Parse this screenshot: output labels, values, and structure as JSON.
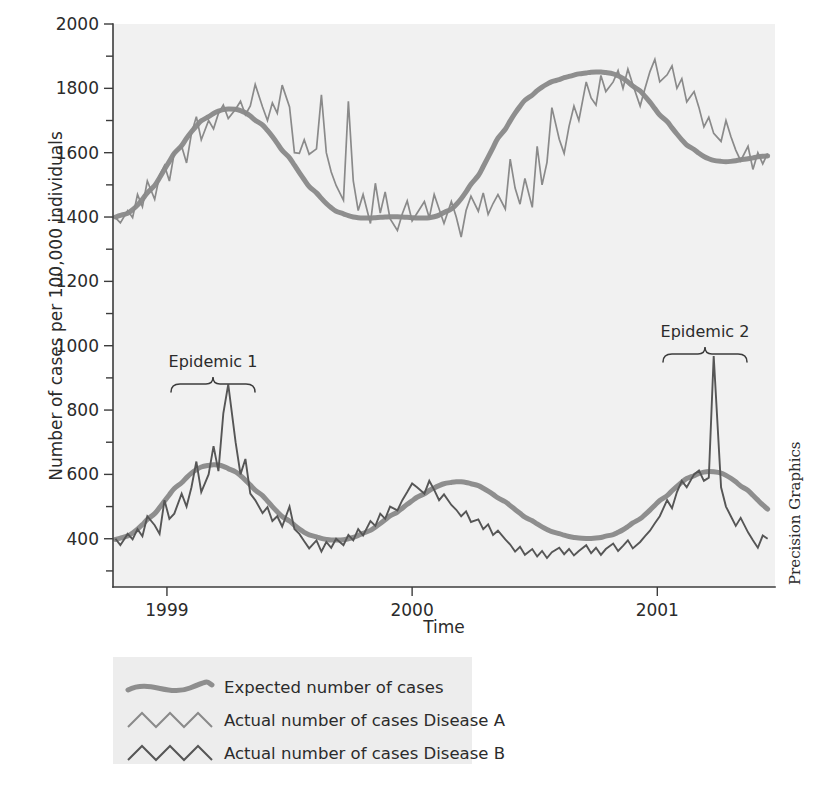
{
  "credit": "Precision Graphics",
  "annotations": [
    {
      "label": "Epidemic 1",
      "x_center": 213,
      "text_y": 367,
      "brace_y": 383,
      "brace_half": 42
    },
    {
      "label": "Epidemic 2",
      "x_center": 705,
      "text_y": 337,
      "brace_y": 353,
      "brace_half": 42
    }
  ],
  "legend": {
    "items": [
      {
        "label": "Expected number of cases",
        "style": "smooth",
        "color": "#8e8e8e"
      },
      {
        "label": "Actual number of cases Disease A",
        "style": "zigzag",
        "color": "#8a8a8a"
      },
      {
        "label": "Actual number of cases Disease B",
        "style": "zigzag",
        "color": "#565656"
      }
    ]
  },
  "chart_data": {
    "type": "line",
    "title": "",
    "xlabel": "Time",
    "ylabel": "Number of cases per 100,000 individuals",
    "xlim": [
      1998.78,
      2001.48
    ],
    "ylim": [
      250,
      2000
    ],
    "grid": false,
    "legend_position": "below-plot",
    "x_ticks": [
      {
        "value": 1999,
        "label": "1999"
      },
      {
        "value": 2000,
        "label": "2000"
      },
      {
        "value": 2001,
        "label": "2001"
      }
    ],
    "y_ticks_major": [
      {
        "value": 400,
        "label": "400"
      },
      {
        "value": 600,
        "label": "600"
      },
      {
        "value": 800,
        "label": "800"
      },
      {
        "value": 1000,
        "label": "1000"
      },
      {
        "value": 1200,
        "label": "1200"
      },
      {
        "value": 1400,
        "label": "1400"
      },
      {
        "value": 1600,
        "label": "1600"
      },
      {
        "value": 1800,
        "label": "1800"
      },
      {
        "value": 2000,
        "label": "2000"
      }
    ],
    "y_ticks_minor": [
      300,
      500,
      700,
      900,
      1100,
      1300,
      1500,
      1700,
      1900
    ],
    "x": [
      1998.79,
      1998.81,
      1998.84,
      1998.86,
      1998.88,
      1998.9,
      1998.92,
      1998.95,
      1998.97,
      1998.99,
      1999.01,
      1999.03,
      1999.06,
      1999.08,
      1999.1,
      1999.12,
      1999.14,
      1999.17,
      1999.19,
      1999.21,
      1999.23,
      1999.25,
      1999.28,
      1999.3,
      1999.32,
      1999.34,
      1999.36,
      1999.39,
      1999.41,
      1999.43,
      1999.45,
      1999.47,
      1999.5,
      1999.52,
      1999.54,
      1999.56,
      1999.58,
      1999.61,
      1999.63,
      1999.65,
      1999.67,
      1999.69,
      1999.72,
      1999.74,
      1999.76,
      1999.78,
      1999.8,
      1999.83,
      1999.85,
      1999.87,
      1999.89,
      1999.91,
      1999.94,
      1999.96,
      1999.98,
      2000.0,
      2000.02,
      2000.05,
      2000.07,
      2000.09,
      2000.11,
      2000.13,
      2000.16,
      2000.18,
      2000.2,
      2000.22,
      2000.24,
      2000.27,
      2000.29,
      2000.31,
      2000.33,
      2000.35,
      2000.38,
      2000.4,
      2000.42,
      2000.44,
      2000.46,
      2000.49,
      2000.51,
      2000.53,
      2000.55,
      2000.57,
      2000.6,
      2000.62,
      2000.64,
      2000.66,
      2000.68,
      2000.71,
      2000.73,
      2000.75,
      2000.77,
      2000.79,
      2000.82,
      2000.84,
      2000.86,
      2000.88,
      2000.9,
      2000.93,
      2000.95,
      2000.97,
      2000.99,
      2001.01,
      2001.04,
      2001.06,
      2001.08,
      2001.1,
      2001.12,
      2001.15,
      2001.17,
      2001.19,
      2001.21,
      2001.23,
      2001.26,
      2001.28,
      2001.3,
      2001.32,
      2001.34,
      2001.37,
      2001.39,
      2001.41,
      2001.43,
      2001.45
    ],
    "series": [
      {
        "name": "Expected number of cases",
        "role": "expected",
        "applies_to": "Disease A",
        "color": "#8e8e8e",
        "values": [
          1400,
          1405,
          1412,
          1423,
          1437,
          1455,
          1475,
          1498,
          1522,
          1548,
          1573,
          1598,
          1622,
          1645,
          1665,
          1683,
          1699,
          1712,
          1722,
          1729,
          1734,
          1736,
          1735,
          1731,
          1724,
          1714,
          1701,
          1686,
          1669,
          1650,
          1629,
          1607,
          1584,
          1561,
          1538,
          1516,
          1495,
          1475,
          1458,
          1442,
          1429,
          1418,
          1410,
          1404,
          1400,
          1398,
          1397,
          1397,
          1398,
          1399,
          1400,
          1401,
          1401,
          1400,
          1399,
          1398,
          1397,
          1397,
          1398,
          1401,
          1406,
          1414,
          1425,
          1439,
          1457,
          1478,
          1502,
          1529,
          1557,
          1586,
          1616,
          1645,
          1673,
          1699,
          1723,
          1744,
          1763,
          1779,
          1793,
          1804,
          1813,
          1821,
          1827,
          1833,
          1837,
          1841,
          1845,
          1848,
          1850,
          1851,
          1851,
          1849,
          1845,
          1839,
          1831,
          1820,
          1807,
          1792,
          1775,
          1757,
          1737,
          1717,
          1697,
          1677,
          1658,
          1640,
          1624,
          1610,
          1598,
          1588,
          1581,
          1576,
          1573,
          1572,
          1573,
          1575,
          1578,
          1581,
          1584,
          1587,
          1589,
          1590
        ]
      },
      {
        "name": "Actual number of cases Disease A",
        "role": "actual",
        "color": "#8a8a8a",
        "values": [
          1398,
          1382,
          1420,
          1398,
          1470,
          1432,
          1512,
          1455,
          1530,
          1560,
          1512,
          1600,
          1620,
          1568,
          1660,
          1712,
          1640,
          1700,
          1674,
          1722,
          1748,
          1706,
          1735,
          1760,
          1718,
          1745,
          1812,
          1742,
          1700,
          1755,
          1723,
          1810,
          1742,
          1600,
          1598,
          1640,
          1595,
          1612,
          1780,
          1600,
          1540,
          1498,
          1452,
          1760,
          1512,
          1420,
          1470,
          1380,
          1505,
          1412,
          1478,
          1395,
          1358,
          1410,
          1450,
          1388,
          1412,
          1448,
          1398,
          1470,
          1425,
          1380,
          1448,
          1400,
          1338,
          1420,
          1465,
          1418,
          1475,
          1408,
          1442,
          1470,
          1425,
          1580,
          1490,
          1440,
          1520,
          1430,
          1620,
          1500,
          1570,
          1740,
          1642,
          1598,
          1682,
          1745,
          1700,
          1820,
          1770,
          1748,
          1840,
          1790,
          1820,
          1855,
          1800,
          1860,
          1812,
          1745,
          1800,
          1852,
          1890,
          1820,
          1842,
          1870,
          1800,
          1830,
          1758,
          1790,
          1740,
          1680,
          1710,
          1660,
          1635,
          1700,
          1650,
          1608,
          1575,
          1620,
          1548,
          1600,
          1565,
          1598
        ]
      },
      {
        "name": "Expected number of cases",
        "role": "expected",
        "applies_to": "Disease B",
        "color": "#8e8e8e",
        "values": [
          398,
          402,
          409,
          418,
          430,
          444,
          460,
          478,
          497,
          517,
          537,
          556,
          574,
          590,
          604,
          615,
          623,
          628,
          630,
          629,
          625,
          618,
          608,
          596,
          582,
          567,
          551,
          534,
          517,
          500,
          484,
          469,
          455,
          442,
          430,
          420,
          412,
          406,
          401,
          398,
          396,
          396,
          397,
          400,
          404,
          410,
          417,
          426,
          436,
          447,
          459,
          471,
          483,
          495,
          507,
          518,
          529,
          540,
          550,
          558,
          565,
          571,
          575,
          577,
          577,
          575,
          571,
          565,
          557,
          548,
          538,
          527,
          515,
          503,
          491,
          479,
          467,
          456,
          446,
          437,
          429,
          422,
          416,
          411,
          407,
          404,
          402,
          401,
          401,
          402,
          404,
          408,
          413,
          420,
          428,
          438,
          449,
          462,
          475,
          489,
          504,
          519,
          534,
          549,
          563,
          576,
          587,
          596,
          603,
          607,
          609,
          608,
          604,
          597,
          588,
          577,
          564,
          550,
          535,
          520,
          505,
          492
        ]
      },
      {
        "name": "Actual number of cases Disease B",
        "role": "actual",
        "color": "#565656",
        "values": [
          400,
          380,
          415,
          398,
          430,
          408,
          470,
          442,
          415,
          520,
          462,
          478,
          540,
          500,
          560,
          640,
          545,
          600,
          688,
          610,
          790,
          880,
          700,
          600,
          648,
          540,
          520,
          480,
          498,
          455,
          470,
          438,
          500,
          430,
          415,
          392,
          370,
          395,
          360,
          390,
          372,
          400,
          380,
          412,
          395,
          430,
          410,
          455,
          440,
          478,
          462,
          500,
          488,
          520,
          545,
          572,
          560,
          540,
          580,
          552,
          520,
          538,
          505,
          490,
          470,
          485,
          452,
          460,
          430,
          445,
          412,
          425,
          398,
          382,
          360,
          375,
          350,
          368,
          345,
          362,
          340,
          358,
          372,
          352,
          368,
          348,
          362,
          380,
          355,
          372,
          350,
          368,
          385,
          362,
          378,
          395,
          370,
          390,
          408,
          425,
          448,
          470,
          520,
          495,
          545,
          580,
          560,
          600,
          612,
          580,
          590,
          968,
          560,
          500,
          470,
          440,
          465,
          420,
          395,
          372,
          410,
          400
        ]
      }
    ]
  }
}
